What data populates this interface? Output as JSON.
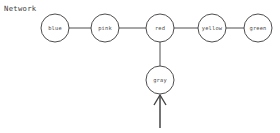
{
  "title": "Network",
  "colors": {
    "background": "#ffffff",
    "stroke": "#3a3a3a",
    "label": "#4a4a4a",
    "arrow": "#444444",
    "node_fill": "#ffffff"
  },
  "chart_data": {
    "type": "diagram",
    "subtype": "node-link-network",
    "title": "Network",
    "node_radius": 14,
    "nodes": [
      {
        "id": "blue",
        "label": "blue",
        "x": 55,
        "y": 28
      },
      {
        "id": "pink",
        "label": "pink",
        "x": 105,
        "y": 28
      },
      {
        "id": "red",
        "label": "red",
        "x": 160,
        "y": 28
      },
      {
        "id": "yellow",
        "label": "yellow",
        "x": 212,
        "y": 28
      },
      {
        "id": "green",
        "label": "green",
        "x": 258,
        "y": 28
      },
      {
        "id": "gray",
        "label": "gray",
        "x": 160,
        "y": 80
      }
    ],
    "edges": [
      {
        "from": "blue",
        "to": "pink",
        "x1": 69,
        "y1": 28,
        "x2": 91,
        "y2": 28
      },
      {
        "from": "pink",
        "to": "red",
        "x1": 119,
        "y1": 28,
        "x2": 146,
        "y2": 28
      },
      {
        "from": "red",
        "to": "yellow",
        "x1": 174,
        "y1": 28,
        "x2": 198,
        "y2": 28
      },
      {
        "from": "yellow",
        "to": "green",
        "x1": 226,
        "y1": 28,
        "x2": 244,
        "y2": 28
      },
      {
        "from": "red",
        "to": "gray",
        "x1": 160,
        "y1": 42,
        "x2": 160,
        "y2": 66
      }
    ],
    "annotations": [
      {
        "name": "input-arrow",
        "type": "arrow",
        "direction": "up",
        "target": "gray",
        "tail_x": 160,
        "tail_y": 128,
        "tip_x": 160,
        "tip_y": 95,
        "head_left_x": 154,
        "head_left_y": 105,
        "head_right_x": 166,
        "head_right_y": 105
      }
    ]
  }
}
